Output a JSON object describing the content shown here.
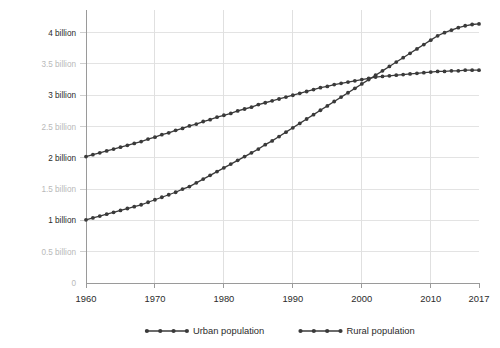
{
  "chart_data": {
    "type": "line",
    "title": "",
    "subtitle": "",
    "xlabel": "",
    "ylabel": "",
    "xlim": [
      1960,
      2017
    ],
    "ylim": [
      0,
      4.25
    ],
    "grid": true,
    "legend_position": "bottom-center",
    "x_tick_labels": [
      "1960",
      "1970",
      "1980",
      "1990",
      "2000",
      "2010",
      "2017"
    ],
    "x_ticks": [
      1960,
      1970,
      1980,
      1990,
      2000,
      2010,
      2017
    ],
    "y_ticks": [
      0,
      0.5,
      1,
      1.5,
      2,
      2.5,
      3,
      3.5,
      4
    ],
    "y_tick_labels": [
      "0",
      "0.5 billion",
      "1 billion",
      "1.5 billion",
      "2 billion",
      "2.5 billion",
      "3 billion",
      "3.5 billion",
      "4 billion"
    ],
    "y_tick_emphasis": [
      false,
      false,
      true,
      false,
      true,
      false,
      true,
      false,
      true
    ],
    "x": [
      1960,
      1961,
      1962,
      1963,
      1964,
      1965,
      1966,
      1967,
      1968,
      1969,
      1970,
      1971,
      1972,
      1973,
      1974,
      1975,
      1976,
      1977,
      1978,
      1979,
      1980,
      1981,
      1982,
      1983,
      1984,
      1985,
      1986,
      1987,
      1988,
      1989,
      1990,
      1991,
      1992,
      1993,
      1994,
      1995,
      1996,
      1997,
      1998,
      1999,
      2000,
      2001,
      2002,
      2003,
      2004,
      2005,
      2006,
      2007,
      2008,
      2009,
      2010,
      2011,
      2012,
      2013,
      2014,
      2015,
      2016,
      2017
    ],
    "series": [
      {
        "name": "Urban population",
        "color": "#3a3a3a",
        "marker": "circle",
        "values": [
          1.01,
          1.04,
          1.07,
          1.1,
          1.13,
          1.16,
          1.19,
          1.22,
          1.25,
          1.29,
          1.33,
          1.37,
          1.41,
          1.45,
          1.5,
          1.54,
          1.6,
          1.66,
          1.72,
          1.78,
          1.84,
          1.9,
          1.96,
          2.02,
          2.08,
          2.14,
          2.21,
          2.27,
          2.34,
          2.41,
          2.48,
          2.55,
          2.62,
          2.69,
          2.76,
          2.83,
          2.9,
          2.97,
          3.04,
          3.11,
          3.18,
          3.25,
          3.32,
          3.39,
          3.46,
          3.53,
          3.6,
          3.67,
          3.74,
          3.81,
          3.88,
          3.95,
          4.0,
          4.04,
          4.08,
          4.11,
          4.13,
          4.14
        ]
      },
      {
        "name": "Rural population",
        "color": "#3a3a3a",
        "marker": "circle",
        "values": [
          2.02,
          2.05,
          2.08,
          2.11,
          2.14,
          2.17,
          2.2,
          2.23,
          2.26,
          2.3,
          2.33,
          2.37,
          2.4,
          2.44,
          2.47,
          2.51,
          2.54,
          2.58,
          2.61,
          2.65,
          2.68,
          2.71,
          2.75,
          2.78,
          2.81,
          2.85,
          2.88,
          2.91,
          2.94,
          2.97,
          3.0,
          3.03,
          3.06,
          3.09,
          3.12,
          3.14,
          3.17,
          3.19,
          3.21,
          3.23,
          3.25,
          3.27,
          3.29,
          3.3,
          3.31,
          3.32,
          3.33,
          3.34,
          3.35,
          3.36,
          3.37,
          3.38,
          3.38,
          3.39,
          3.39,
          3.4,
          3.4,
          3.4
        ]
      }
    ],
    "legend": [
      {
        "label": "Urban population",
        "color": "#3a3a3a"
      },
      {
        "label": "Rural population",
        "color": "#3a3a3a"
      }
    ]
  }
}
